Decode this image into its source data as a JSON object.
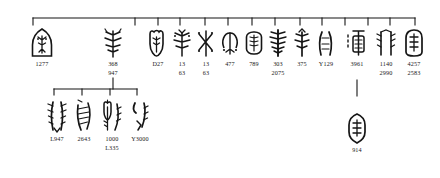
{
  "figure": {
    "ink_color": "#151515",
    "background": "#ffffff",
    "upper_bracket": {
      "name": "upper-connector-bracket",
      "x_start": 33,
      "x_end": 415,
      "y": 18,
      "tick_length": 7,
      "tick_positions": [
        33,
        135,
        158,
        180,
        205,
        228,
        252,
        275,
        300,
        322,
        345,
        368,
        390,
        415
      ]
    },
    "lower_bracket": {
      "name": "lower-connector-bracket",
      "x_start": 54,
      "x_end": 137,
      "y": 89,
      "tick_length": 6,
      "tick_positions": [
        54,
        82,
        110,
        137
      ]
    },
    "stems": [
      {
        "name": "stem-947-to-lower-bracket",
        "x": 113,
        "y_top": 78,
        "y_bottom": 89
      },
      {
        "name": "stem-3961-to-914",
        "x": 357,
        "y_top": 80,
        "y_bottom": 96
      }
    ]
  },
  "upper_row": [
    {
      "id": "n1277",
      "x": 42,
      "labels": [
        "1277"
      ]
    },
    {
      "id": "n368",
      "x": 113,
      "labels": [
        "368",
        "947"
      ]
    },
    {
      "id": "nD27",
      "x": 158,
      "labels": [
        "D27"
      ]
    },
    {
      "id": "n13a",
      "x": 182,
      "labels": [
        "13",
        "63"
      ]
    },
    {
      "id": "n13b",
      "x": 206,
      "labels": [
        "13",
        "63"
      ]
    },
    {
      "id": "n477",
      "x": 230,
      "labels": [
        "477"
      ]
    },
    {
      "id": "n789",
      "x": 254,
      "labels": [
        "789"
      ]
    },
    {
      "id": "n303",
      "x": 278,
      "labels": [
        "303",
        "2075"
      ]
    },
    {
      "id": "n375",
      "x": 302,
      "labels": [
        "375"
      ]
    },
    {
      "id": "nY129",
      "x": 326,
      "labels": [
        "Y129"
      ]
    },
    {
      "id": "n3961",
      "x": 357,
      "labels": [
        "3961"
      ]
    },
    {
      "id": "n1140",
      "x": 386,
      "labels": [
        "1140",
        "2990"
      ]
    },
    {
      "id": "n4257",
      "x": 414,
      "labels": [
        "4257",
        "2583"
      ]
    }
  ],
  "lower_row": [
    {
      "id": "nL947",
      "x": 57,
      "labels": [
        "L947"
      ]
    },
    {
      "id": "n2643",
      "x": 84,
      "labels": [
        "2643"
      ]
    },
    {
      "id": "n1000",
      "x": 112,
      "labels": [
        "1000",
        "L335"
      ]
    },
    {
      "id": "nY3000",
      "x": 140,
      "labels": [
        "Y3000"
      ]
    },
    {
      "id": "n914",
      "x": 357,
      "labels": [
        "914"
      ]
    }
  ]
}
